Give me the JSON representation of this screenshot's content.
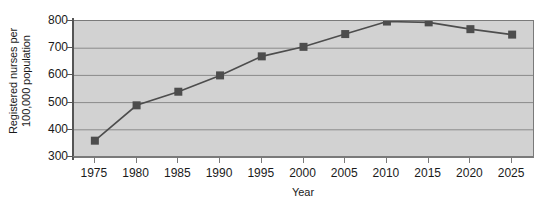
{
  "chart_data": {
    "type": "line",
    "title": "",
    "subtitle": "",
    "xlabel": "Year",
    "ylabel": "Registered nurses per 100,000 population",
    "ylabel_line1": "Registered nurses per",
    "ylabel_line2": "100,000 population",
    "categories": [
      "1975",
      "1980",
      "1985",
      "1990",
      "1995",
      "2000",
      "2005",
      "2010",
      "2015",
      "2020",
      "2025"
    ],
    "x": [
      1975,
      1980,
      1985,
      1990,
      1995,
      2000,
      2005,
      2010,
      2015,
      2020,
      2025
    ],
    "values": [
      360,
      490,
      540,
      600,
      670,
      705,
      752,
      798,
      795,
      770,
      750
    ],
    "series": [
      {
        "name": "Registered nurses per 100,000 population",
        "values": [
          360,
          490,
          540,
          600,
          670,
          705,
          752,
          798,
          795,
          770,
          750
        ]
      }
    ],
    "ylim": [
      300,
      800
    ],
    "yticks": [
      300,
      400,
      500,
      600,
      700,
      800
    ],
    "ytick_labels": [
      "300",
      "400",
      "500",
      "600",
      "700",
      "800"
    ],
    "xlim": [
      1972.5,
      2027.5
    ],
    "grid": "horizontal",
    "legend": "none",
    "marker": "square",
    "colors": {
      "plot_background": "#d2d2d2",
      "page_background": "#ffffff",
      "line": "#4d4d4d",
      "marker": "#4d4d4d",
      "gridline": "#8a8a8a",
      "axis": "#555555",
      "text": "#1a1a1a"
    }
  }
}
